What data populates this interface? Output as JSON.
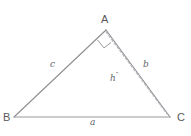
{
  "figure": {
    "background_color": "#ffffff",
    "stroke_color": "#8e8e93",
    "dash_color": "#b6b6bb",
    "text_color": "#5e5e62"
  },
  "vertices": [
    {
      "name": "A",
      "label": "A",
      "x": 106,
      "y": 30
    },
    {
      "name": "B",
      "label": "B",
      "x": 14,
      "y": 117
    },
    {
      "name": "C",
      "label": "C",
      "x": 170,
      "y": 117
    }
  ],
  "sides": [
    {
      "name": "side-a",
      "label": "a",
      "from": "B",
      "to": "C"
    },
    {
      "name": "side-b",
      "label": "b",
      "from": "A",
      "to": "C"
    },
    {
      "name": "side-c",
      "label": "c",
      "from": "B",
      "to": "A"
    }
  ],
  "altitude": {
    "name": "altitude-h",
    "label_base": "h",
    "label_prime": "″",
    "style": "dashed",
    "from": "A",
    "to_x": 167,
    "to_y": 114
  },
  "right_angle": {
    "name": "right-angle-marker",
    "at_vertex": "A",
    "between": [
      "side-c",
      "altitude-h"
    ],
    "size": 11
  }
}
